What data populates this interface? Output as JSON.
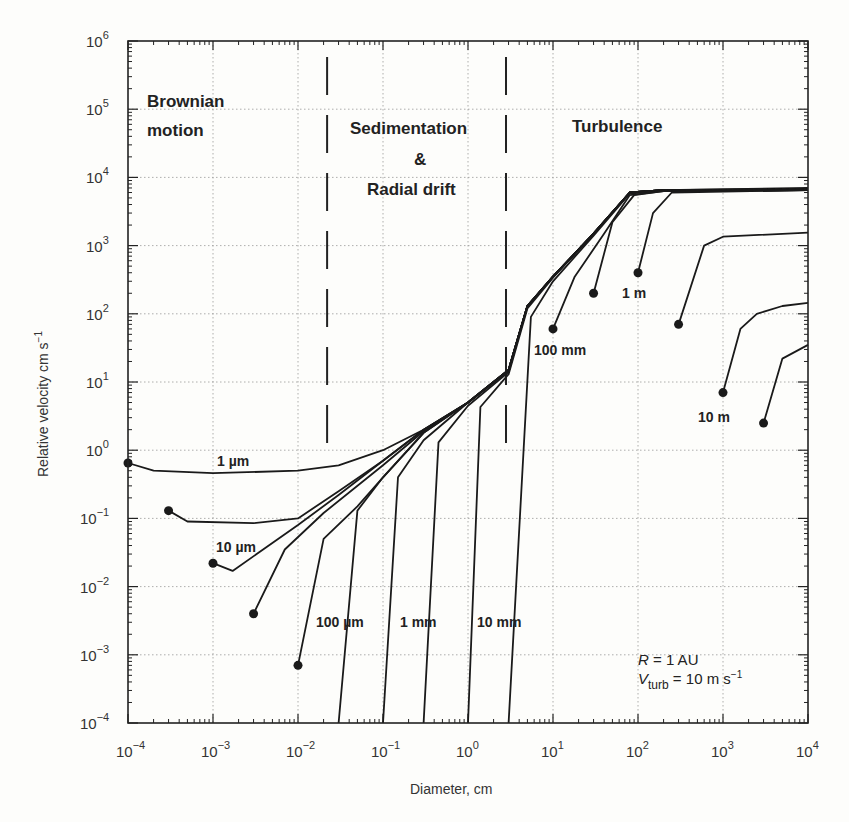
{
  "chart_data": {
    "type": "line",
    "title": "",
    "xlabel": "Diameter,  cm",
    "ylabel": "Relative velocity  cm s⁻¹",
    "xscale": "log",
    "yscale": "log",
    "xlim": [
      0.0001,
      10000
    ],
    "ylim": [
      0.0001,
      1000000
    ],
    "grid": true,
    "x_ticks": [
      "10^-4",
      "10^-3",
      "10^-2",
      "10^-1",
      "10^0",
      "10^1",
      "10^2",
      "10^3",
      "10^4"
    ],
    "y_ticks": [
      "10^-4",
      "10^-3",
      "10^-2",
      "10^-1",
      "10^0",
      "10^1",
      "10^2",
      "10^3",
      "10^4",
      "10^5",
      "10^6"
    ],
    "regions": [
      {
        "label": "Brownian\nmotion",
        "x_range": [
          0.0001,
          0.02
        ]
      },
      {
        "label": "Sedimentation\n&\nRadial drift",
        "x_range": [
          0.02,
          3
        ]
      },
      {
        "label": "Turbulence",
        "x_range": [
          3,
          10000
        ]
      }
    ],
    "region_boundaries_x": [
      0.022,
      2.8
    ],
    "annotations": [
      "R = 1 AU",
      "V_turb = 10 m s^-1"
    ],
    "series": [
      {
        "name": "1 µm",
        "start_diameter": 0.0001,
        "points": [
          [
            0.0001,
            0.65
          ],
          [
            0.0002,
            0.5
          ],
          [
            0.001,
            0.46
          ],
          [
            0.01,
            0.5
          ],
          [
            0.03,
            0.6
          ],
          [
            0.1,
            1.0
          ],
          [
            0.3,
            2.0
          ],
          [
            1,
            5
          ],
          [
            3,
            15
          ],
          [
            5,
            130
          ],
          [
            10,
            350
          ],
          [
            30,
            1500
          ],
          [
            80,
            6000
          ],
          [
            200,
            6500
          ],
          [
            10000,
            7000
          ]
        ]
      },
      {
        "name": "3 µm",
        "start_diameter": 0.0003,
        "points": [
          [
            0.0003,
            0.13
          ],
          [
            0.0005,
            0.09
          ],
          [
            0.003,
            0.085
          ],
          [
            0.01,
            0.1
          ],
          [
            0.03,
            0.25
          ],
          [
            0.1,
            0.7
          ],
          [
            0.3,
            2.0
          ],
          [
            1,
            5
          ],
          [
            3,
            15
          ],
          [
            5,
            130
          ],
          [
            10,
            350
          ],
          [
            30,
            1500
          ],
          [
            80,
            6000
          ],
          [
            200,
            6500
          ],
          [
            10000,
            6800
          ]
        ]
      },
      {
        "name": "10 µm",
        "start_diameter": 0.001,
        "points": [
          [
            0.001,
            0.022
          ],
          [
            0.0017,
            0.017
          ],
          [
            0.01,
            0.08
          ],
          [
            0.03,
            0.22
          ],
          [
            0.1,
            0.7
          ],
          [
            0.3,
            2.0
          ],
          [
            1,
            5
          ],
          [
            3,
            15
          ],
          [
            5,
            130
          ],
          [
            10,
            350
          ],
          [
            30,
            1500
          ],
          [
            80,
            6000
          ],
          [
            200,
            6500
          ],
          [
            10000,
            6700
          ]
        ]
      },
      {
        "name": "30 µm",
        "start_diameter": 0.003,
        "points": [
          [
            0.003,
            0.004
          ],
          [
            0.007,
            0.035
          ],
          [
            0.02,
            0.12
          ],
          [
            0.1,
            0.6
          ],
          [
            0.3,
            1.9
          ],
          [
            1,
            5
          ],
          [
            3,
            15
          ],
          [
            5,
            130
          ],
          [
            10,
            350
          ],
          [
            30,
            1500
          ],
          [
            80,
            6000
          ],
          [
            200,
            6500
          ],
          [
            10000,
            6600
          ]
        ]
      },
      {
        "name": "100 µm",
        "start_diameter": 0.01,
        "points": [
          [
            0.01,
            0.0007
          ],
          [
            0.02,
            0.05
          ],
          [
            0.05,
            0.15
          ],
          [
            0.1,
            0.4
          ],
          [
            0.3,
            1.8
          ],
          [
            1,
            5
          ],
          [
            3,
            15
          ],
          [
            5,
            130
          ],
          [
            10,
            350
          ],
          [
            30,
            1500
          ],
          [
            80,
            6000
          ],
          [
            200,
            6500
          ],
          [
            10000,
            6600
          ]
        ]
      },
      {
        "name": "300 µm",
        "start_diameter": 0.03,
        "points": [
          [
            0.03,
            0.0001
          ],
          [
            0.05,
            0.13
          ],
          [
            0.1,
            0.4
          ],
          [
            0.3,
            1.8
          ],
          [
            1,
            5
          ],
          [
            3,
            15
          ],
          [
            5,
            130
          ],
          [
            10,
            350
          ],
          [
            30,
            1500
          ],
          [
            80,
            6000
          ],
          [
            200,
            6500
          ],
          [
            10000,
            6600
          ]
        ]
      },
      {
        "name": "1 mm",
        "start_diameter": 0.1,
        "points": [
          [
            0.1,
            0.0001
          ],
          [
            0.15,
            0.4
          ],
          [
            0.3,
            1.4
          ],
          [
            1,
            5
          ],
          [
            3,
            15
          ],
          [
            5,
            130
          ],
          [
            10,
            350
          ],
          [
            30,
            1500
          ],
          [
            80,
            6000
          ],
          [
            200,
            6500
          ],
          [
            10000,
            6600
          ]
        ]
      },
      {
        "name": "3 mm",
        "start_diameter": 0.3,
        "points": [
          [
            0.3,
            0.0001
          ],
          [
            0.45,
            1.3
          ],
          [
            1,
            4.5
          ],
          [
            3,
            14
          ],
          [
            5,
            130
          ],
          [
            10,
            350
          ],
          [
            30,
            1500
          ],
          [
            80,
            6000
          ],
          [
            200,
            6500
          ],
          [
            10000,
            6600
          ]
        ]
      },
      {
        "name": "10 mm",
        "start_diameter": 1,
        "points": [
          [
            1,
            0.0001
          ],
          [
            1.4,
            4.3
          ],
          [
            3,
            13
          ],
          [
            5,
            120
          ],
          [
            10,
            340
          ],
          [
            30,
            1500
          ],
          [
            80,
            6000
          ],
          [
            200,
            6500
          ],
          [
            10000,
            6600
          ]
        ]
      },
      {
        "name": "30 mm",
        "start_diameter": 3,
        "points": [
          [
            3,
            0.0001
          ],
          [
            5.5,
            90
          ],
          [
            10,
            300
          ],
          [
            30,
            1400
          ],
          [
            80,
            5800
          ],
          [
            200,
            6400
          ],
          [
            10000,
            6600
          ]
        ]
      },
      {
        "name": "100 mm",
        "start_diameter": 10,
        "points": [
          [
            10,
            60
          ],
          [
            18,
            350
          ],
          [
            40,
            1500
          ],
          [
            80,
            5500
          ],
          [
            200,
            6300
          ],
          [
            10000,
            6500
          ]
        ]
      },
      {
        "name": "300 mm",
        "start_diameter": 30,
        "points": [
          [
            30,
            200
          ],
          [
            50,
            2200
          ],
          [
            90,
            5500
          ],
          [
            200,
            6300
          ],
          [
            10000,
            6500
          ]
        ]
      },
      {
        "name": "1 m",
        "start_diameter": 100,
        "points": [
          [
            100,
            400
          ],
          [
            150,
            3000
          ],
          [
            250,
            6000
          ],
          [
            10000,
            6500
          ]
        ]
      },
      {
        "name": "3 m",
        "start_diameter": 300,
        "points": [
          [
            300,
            70
          ],
          [
            600,
            1000
          ],
          [
            1000,
            1350
          ],
          [
            10000,
            1550
          ]
        ]
      },
      {
        "name": "10 m",
        "start_diameter": 1000,
        "points": [
          [
            1000,
            7
          ],
          [
            1600,
            60
          ],
          [
            2500,
            100
          ],
          [
            5000,
            130
          ],
          [
            10000,
            145
          ]
        ]
      },
      {
        "name": "30 m",
        "start_diameter": 3000,
        "points": [
          [
            3000,
            2.5
          ],
          [
            5000,
            22
          ],
          [
            10000,
            35
          ]
        ]
      }
    ]
  },
  "labels": {
    "regions": {
      "brownian_line1": "Brownian",
      "brownian_line2": "motion",
      "sed_line1": "Sedimentation",
      "sed_line2": "&",
      "sed_line3": "Radial drift",
      "turbulence": "Turbulence"
    },
    "curves": {
      "um1": "1 µm",
      "um10": "10 µm",
      "um100": "100 µm",
      "mm1": "1 mm",
      "mm10": "10 mm",
      "mm100": "100 mm",
      "m1": "1 m",
      "m10": "10 m"
    },
    "annotation_R_sym": "R",
    "annotation_R_val": " = 1 AU",
    "annotation_V_sym": "V",
    "annotation_V_sub": "turb",
    "annotation_V_val": " = 10 m s",
    "annotation_V_exp": "−1",
    "xlabel": "Diameter,  cm",
    "ylabel": "Relative velocity  cm s",
    "ylabel_exp": "−1"
  }
}
